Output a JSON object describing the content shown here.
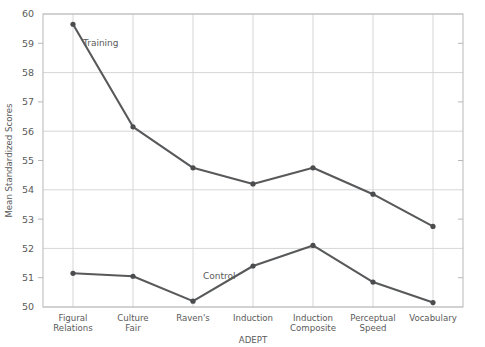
{
  "chart_data": {
    "type": "line",
    "title": "",
    "xlabel": "ADEPT",
    "ylabel": "Mean Standardized Scores",
    "categories": [
      "Figural Relations",
      "Culture Fair",
      "Raven's",
      "Induction",
      "Induction Composite",
      "Perceptual Speed",
      "Vocabulary"
    ],
    "category_lines": [
      [
        "Figural",
        "Relations"
      ],
      [
        "Culture",
        "Fair"
      ],
      [
        "Raven's"
      ],
      [
        "Induction"
      ],
      [
        "Induction",
        "Composite"
      ],
      [
        "Perceptual",
        "Speed"
      ],
      [
        "Vocabulary"
      ]
    ],
    "series": [
      {
        "name": "Training",
        "color": "#58595b",
        "values": [
          59.65,
          56.15,
          54.75,
          54.2,
          54.75,
          53.85,
          52.75
        ]
      },
      {
        "name": "Control",
        "color": "#58595b",
        "values": [
          51.15,
          51.05,
          50.2,
          51.4,
          52.1,
          50.85,
          50.15
        ]
      }
    ],
    "ylim": [
      50,
      60
    ],
    "ytick_values": [
      50,
      51,
      52,
      53,
      54,
      55,
      56,
      57,
      58,
      59,
      60
    ],
    "ytick_labels": [
      "50",
      "51",
      "52",
      "53",
      "54",
      "55",
      "56",
      "57",
      "58",
      "59",
      "60"
    ],
    "gridline_y_values": [
      50,
      52,
      54,
      56,
      58,
      60
    ],
    "grid": true,
    "legend_position": "inline-annotations",
    "annotations": [
      {
        "text": "Training",
        "category_index": 0,
        "value": 59.0
      },
      {
        "text": "Control",
        "category_index": 2,
        "value": 51.05
      }
    ],
    "colors": {
      "line": "#58595b",
      "marker": "#4b4c4e",
      "grid": "#d6d6d6",
      "frame": "#b8b8b8",
      "text": "#5a5a5a",
      "background": "#ffffff"
    }
  }
}
